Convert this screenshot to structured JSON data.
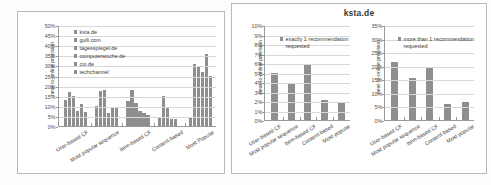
{
  "figure": {
    "background": "#ffffff",
    "bar_color": "#8e8e8e",
    "grid_color": "#d8d8d8",
    "axis_color": "#9a9a9a"
  },
  "chart_data": [
    {
      "id": "left",
      "type": "bar",
      "title": "",
      "xlabel": "",
      "ylabel": "near-to-online precision",
      "ylim": [
        0,
        50
      ],
      "yticks": [
        "0%",
        "5%",
        "10%",
        "15%",
        "20%",
        "25%",
        "30%",
        "35%",
        "40%",
        "45%",
        "50%"
      ],
      "grid": true,
      "legend_position": "upper-left",
      "categories": [
        "User-based CF",
        "Most popular sequence",
        "Item-based CF",
        "Content-based",
        "Most Popular"
      ],
      "series": [
        {
          "name": "ksta.de",
          "values": [
            13.0,
            10.0,
            12.6,
            4.3,
            4.5
          ]
        },
        {
          "name": "gulli.com",
          "values": [
            16.7,
            17.1,
            18.0,
            15.0,
            30.6
          ]
        },
        {
          "name": "tagesspiegel.de",
          "values": [
            14.8,
            18.0,
            11.6,
            9.0,
            29.2
          ]
        },
        {
          "name": "computerwoche.de",
          "values": [
            7.2,
            6.3,
            7.2,
            3.4,
            26.6
          ]
        },
        {
          "name": "cio.de",
          "values": [
            11.1,
            9.4,
            6.6,
            3.4,
            35.5
          ]
        },
        {
          "name": "techchannel",
          "values": [
            6.9,
            9.4,
            5.5,
            0.0,
            24.8
          ]
        }
      ]
    },
    {
      "id": "right-one",
      "type": "bar",
      "title": "",
      "xlabel": "",
      "ylabel": "near-to-online precision",
      "ylim": [
        0,
        10
      ],
      "yticks": [
        "0%",
        "1%",
        "2%",
        "3%",
        "4%",
        "5%",
        "6%",
        "7%",
        "8%",
        "9%",
        "10%"
      ],
      "grid": true,
      "legend_position": "upper-left",
      "categories": [
        "User-based CF",
        "Most popular sequence",
        "Item-based CF",
        "Content-based",
        "Most popular"
      ],
      "series": [
        {
          "name": "exactly 1 recommendation requested",
          "values": [
            5.0,
            3.9,
            5.85,
            2.1,
            1.9
          ]
        }
      ]
    },
    {
      "id": "right-many",
      "type": "bar",
      "title": "",
      "xlabel": "",
      "ylabel": "near-to-online precision",
      "ylim": [
        0,
        35
      ],
      "yticks": [
        "0%",
        "5%",
        "10%",
        "15%",
        "20%",
        "25%",
        "30%",
        "35%"
      ],
      "grid": true,
      "legend_position": "upper-left",
      "categories": [
        "User-based CF",
        "Most popular sequence",
        "Item-based CF",
        "Content-based",
        "Most popular"
      ],
      "series": [
        {
          "name": "more than 1 recommendation requested",
          "values": [
            21.3,
            15.5,
            19.0,
            6.0,
            6.6
          ]
        }
      ]
    }
  ],
  "right_panel": {
    "title": "ksta.de"
  }
}
